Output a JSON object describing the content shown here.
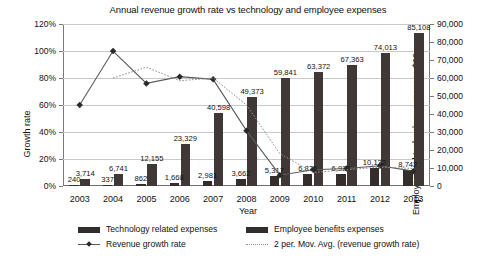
{
  "chart_data": {
    "type": "bar",
    "title": "Annual revenue growth rate vs technology and employee expenses",
    "xlabel": "Year",
    "ylabel": "Growth rate",
    "y2label": "Employee and technology expenses $00",
    "categories": [
      "2003",
      "2004",
      "2005",
      "2006",
      "2007",
      "2008",
      "2009",
      "2010",
      "2011",
      "2012",
      "2013"
    ],
    "ylim": [
      0,
      120
    ],
    "y2lim": [
      0,
      90000
    ],
    "ytick_labels": [
      "0%",
      "20%",
      "40%",
      "60%",
      "80%",
      "100%",
      "120%"
    ],
    "y2tick_labels": [
      "0",
      "10,000",
      "20,000",
      "30,000",
      "40,000",
      "50,000",
      "60,000",
      "70,000",
      "80,000",
      "90,000"
    ],
    "grid": true,
    "legend_position": "bottom",
    "series": [
      {
        "name": "Technology related expenses",
        "type": "bar",
        "axis": "right",
        "color": "#332d2c",
        "values": [
          240,
          337,
          862,
          1668,
          2981,
          3662,
          5317,
          6875,
          6924,
          10132,
          8742
        ],
        "labels": [
          "240",
          "337",
          "862",
          "1,668",
          "2,981",
          "3,662",
          "5,317",
          "6,875",
          "6,924",
          "10,132",
          "8,742"
        ]
      },
      {
        "name": "Employee benefits expenses",
        "type": "bar",
        "axis": "right",
        "color": "#3f3837",
        "values": [
          3714,
          6741,
          12155,
          23329,
          40598,
          49373,
          59841,
          63372,
          67363,
          74013,
          85108
        ],
        "labels": [
          "3,714",
          "6,741",
          "12,155",
          "23,329",
          "40,598",
          "49,373",
          "59,841",
          "63,372",
          "67,363",
          "74,013",
          "85,108"
        ]
      },
      {
        "name": "Revenue growth rate",
        "type": "line",
        "axis": "left",
        "color": "#5a5a5a",
        "values": [
          60,
          100,
          76,
          81,
          79,
          41,
          8,
          12,
          13,
          15,
          11
        ]
      },
      {
        "name": "2 per. Mov. Avg. (revenue growth rate)",
        "type": "line",
        "axis": "left",
        "style": "dotted",
        "color": "#8d8d8d",
        "values": [
          null,
          80,
          88,
          78,
          80,
          60,
          24,
          10,
          12,
          14,
          13
        ]
      }
    ]
  },
  "legend": {
    "items": [
      {
        "label": "Technology related expenses",
        "marker": "square-swatch"
      },
      {
        "label": "Employee benefits expenses",
        "marker": "square-swatch"
      },
      {
        "label": "Revenue growth rate",
        "marker": "line-with-diamond-marker"
      },
      {
        "label": "2 per. Mov. Avg. (revenue growth rate)",
        "marker": "dotted-line"
      }
    ]
  }
}
